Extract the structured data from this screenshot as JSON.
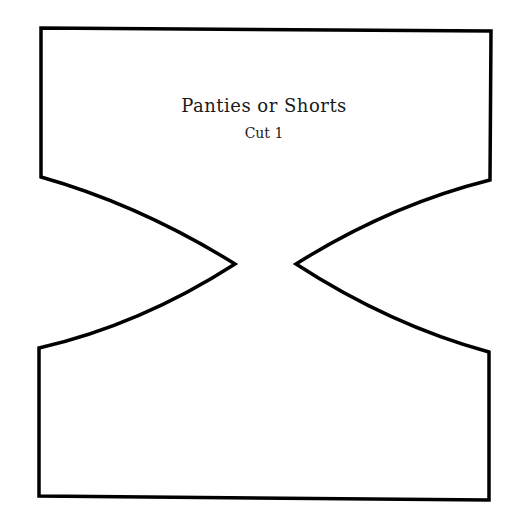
{
  "pattern": {
    "title": "Panties or Shorts",
    "subtitle": "Cut 1",
    "stroke_color": "#000000",
    "background_color": "#ffffff",
    "outline": {
      "top_left": [
        41,
        28
      ],
      "top_right": [
        491,
        31
      ],
      "upper_left_side_end": [
        41,
        177
      ],
      "left_notch_point": [
        235,
        264
      ],
      "lower_left_side_start": [
        39,
        348
      ],
      "bottom_left": [
        39,
        496
      ],
      "bottom_right": [
        489,
        500
      ],
      "lower_right_side_start": [
        489,
        352
      ],
      "right_notch_point": [
        296,
        264
      ],
      "upper_right_side_end": [
        490,
        180
      ]
    }
  }
}
